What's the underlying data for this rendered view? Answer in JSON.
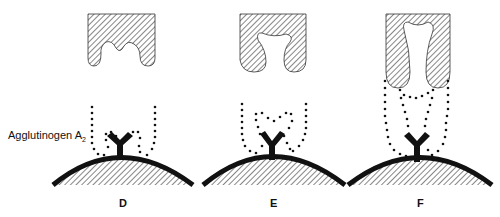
{
  "diagram": {
    "annotation": {
      "text": "Agglutinogen A",
      "subscript": "2"
    },
    "panels": [
      {
        "id": "D",
        "label": "D"
      },
      {
        "id": "E",
        "label": "E"
      },
      {
        "id": "F",
        "label": "F"
      }
    ],
    "colors": {
      "ink": "#111111",
      "background": "#ffffff"
    }
  }
}
